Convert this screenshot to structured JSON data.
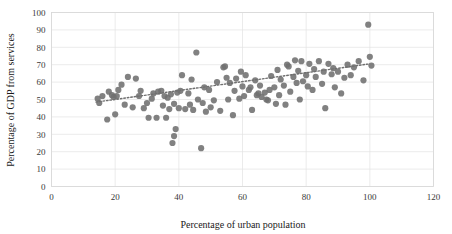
{
  "chart_data": {
    "type": "scatter",
    "title": "",
    "xlabel": "Percentage of urban population",
    "ylabel": "Percentage of GDP from services",
    "xlim": [
      0,
      120
    ],
    "ylim": [
      0,
      100
    ],
    "xticks": [
      0,
      20,
      40,
      60,
      80,
      100,
      120
    ],
    "yticks": [
      0,
      10,
      20,
      30,
      40,
      50,
      60,
      70,
      80,
      90,
      100
    ],
    "grid": true,
    "legend": "none",
    "marker_color": "#6f6f6f",
    "trendline": {
      "type": "linear-dotted",
      "color": "#6f6f6f",
      "x_start": 14,
      "y_start": 48.5,
      "x_end": 100,
      "y_end": 70.5
    },
    "points": [
      [
        14.5,
        50.5
      ],
      [
        15.0,
        48.0
      ],
      [
        16.0,
        52.0
      ],
      [
        17.5,
        38.5
      ],
      [
        18.0,
        54.5
      ],
      [
        19.0,
        52.5
      ],
      [
        19.5,
        51.5
      ],
      [
        20.0,
        41.5
      ],
      [
        20.5,
        52.0
      ],
      [
        21.0,
        55.5
      ],
      [
        22.0,
        58.5
      ],
      [
        23.0,
        47.0
      ],
      [
        24.0,
        63.0
      ],
      [
        25.5,
        45.5
      ],
      [
        26.5,
        62.0
      ],
      [
        27.5,
        52.0
      ],
      [
        28.0,
        55.0
      ],
      [
        29.0,
        45.0
      ],
      [
        30.0,
        48.0
      ],
      [
        30.5,
        39.5
      ],
      [
        31.5,
        50.5
      ],
      [
        32.0,
        53.5
      ],
      [
        33.0,
        39.5
      ],
      [
        33.5,
        54.5
      ],
      [
        34.5,
        55.0
      ],
      [
        35.0,
        46.5
      ],
      [
        35.5,
        52.0
      ],
      [
        36.0,
        39.5
      ],
      [
        36.5,
        51.0
      ],
      [
        37.0,
        44.5
      ],
      [
        37.5,
        53.0
      ],
      [
        38.0,
        25.0
      ],
      [
        38.5,
        29.0
      ],
      [
        38.5,
        47.5
      ],
      [
        39.0,
        33.0
      ],
      [
        39.5,
        54.0
      ],
      [
        40.0,
        45.0
      ],
      [
        40.5,
        55.0
      ],
      [
        41.0,
        64.0
      ],
      [
        42.0,
        44.5
      ],
      [
        43.0,
        53.5
      ],
      [
        43.5,
        47.0
      ],
      [
        44.0,
        61.5
      ],
      [
        44.5,
        44.0
      ],
      [
        45.5,
        77.0
      ],
      [
        46.0,
        50.0
      ],
      [
        47.0,
        22.0
      ],
      [
        47.5,
        48.0
      ],
      [
        48.0,
        57.0
      ],
      [
        48.5,
        43.0
      ],
      [
        49.5,
        55.5
      ],
      [
        50.0,
        45.5
      ],
      [
        51.0,
        49.5
      ],
      [
        52.0,
        60.0
      ],
      [
        53.0,
        43.5
      ],
      [
        54.0,
        68.5
      ],
      [
        54.5,
        69.0
      ],
      [
        55.0,
        62.5
      ],
      [
        55.5,
        50.0
      ],
      [
        56.0,
        59.5
      ],
      [
        57.0,
        41.0
      ],
      [
        57.5,
        55.0
      ],
      [
        58.0,
        62.0
      ],
      [
        59.0,
        50.5
      ],
      [
        59.5,
        66.0
      ],
      [
        60.0,
        57.5
      ],
      [
        60.5,
        52.0
      ],
      [
        61.0,
        64.0
      ],
      [
        62.0,
        55.5
      ],
      [
        62.5,
        57.0
      ],
      [
        63.0,
        44.0
      ],
      [
        64.0,
        61.0
      ],
      [
        64.5,
        52.5
      ],
      [
        65.0,
        53.5
      ],
      [
        65.5,
        58.0
      ],
      [
        66.0,
        51.5
      ],
      [
        67.0,
        54.0
      ],
      [
        67.5,
        50.0
      ],
      [
        68.0,
        49.5
      ],
      [
        68.5,
        55.5
      ],
      [
        69.0,
        63.5
      ],
      [
        70.0,
        57.0
      ],
      [
        70.5,
        47.5
      ],
      [
        71.0,
        67.0
      ],
      [
        71.5,
        52.5
      ],
      [
        72.0,
        61.5
      ],
      [
        73.0,
        58.0
      ],
      [
        73.5,
        47.0
      ],
      [
        74.0,
        70.0
      ],
      [
        74.5,
        69.0
      ],
      [
        75.0,
        54.5
      ],
      [
        76.0,
        63.0
      ],
      [
        76.5,
        72.5
      ],
      [
        77.0,
        59.5
      ],
      [
        77.5,
        66.5
      ],
      [
        78.0,
        50.0
      ],
      [
        78.5,
        72.0
      ],
      [
        79.0,
        60.5
      ],
      [
        80.0,
        64.0
      ],
      [
        80.5,
        57.5
      ],
      [
        81.0,
        70.5
      ],
      [
        82.0,
        55.5
      ],
      [
        82.5,
        67.5
      ],
      [
        83.0,
        63.0
      ],
      [
        84.0,
        72.0
      ],
      [
        85.0,
        59.0
      ],
      [
        85.5,
        66.0
      ],
      [
        86.0,
        45.0
      ],
      [
        87.0,
        70.5
      ],
      [
        88.0,
        64.5
      ],
      [
        88.5,
        68.0
      ],
      [
        89.0,
        57.0
      ],
      [
        90.0,
        66.0
      ],
      [
        91.0,
        53.5
      ],
      [
        92.0,
        62.5
      ],
      [
        93.0,
        70.0
      ],
      [
        94.0,
        64.0
      ],
      [
        95.0,
        68.5
      ],
      [
        96.5,
        72.0
      ],
      [
        98.0,
        61.0
      ],
      [
        99.5,
        93.0
      ],
      [
        100.0,
        74.5
      ],
      [
        100.5,
        69.5
      ]
    ]
  }
}
